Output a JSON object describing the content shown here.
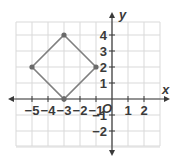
{
  "chart_data": {
    "type": "scatter",
    "title": "",
    "xlabel": "x",
    "ylabel": "y",
    "origin_label": "O",
    "xlim": [
      -6,
      3
    ],
    "ylim": [
      -3,
      4.8
    ],
    "grid": true,
    "x_ticks": [
      -5,
      -4,
      -3,
      -2,
      -1,
      1,
      2
    ],
    "x_tick_labels": [
      "−5",
      "−4",
      "−3",
      "−2",
      "−1",
      "1",
      "2"
    ],
    "y_ticks": [
      4,
      3,
      2,
      1,
      -1,
      -2
    ],
    "y_tick_labels": [
      "4",
      "3",
      "2",
      "1",
      "−1",
      "−2"
    ],
    "series": [
      {
        "name": "square",
        "closed": true,
        "points": [
          [
            -3,
            4
          ],
          [
            -1,
            2
          ],
          [
            -3,
            0
          ],
          [
            -5,
            2
          ]
        ],
        "color": "#808080"
      }
    ],
    "colors": {
      "grid": "#d9d9d9",
      "axis": "#3a3a3a",
      "shape": "#808080"
    }
  }
}
